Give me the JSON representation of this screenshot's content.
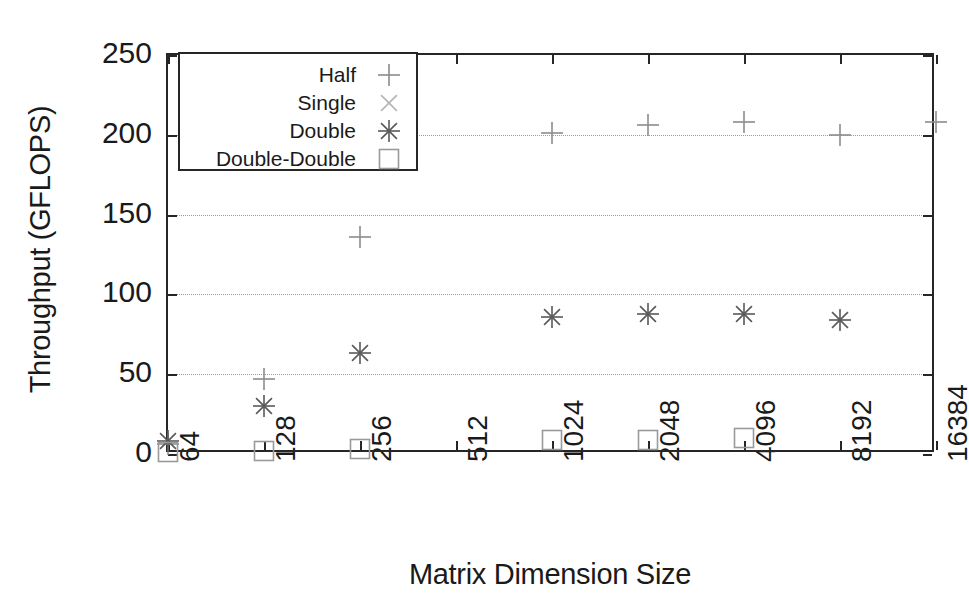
{
  "chart_data": {
    "type": "scatter",
    "title": "",
    "xlabel": "Matrix Dimension Size",
    "ylabel": "Throughput (GFLOPS)",
    "categories": [
      "64",
      "128",
      "256",
      "512",
      "1024",
      "2048",
      "4096",
      "8192",
      "16384"
    ],
    "xlim": [
      0,
      8
    ],
    "ylim": [
      0,
      250
    ],
    "yticks": [
      0,
      50,
      100,
      150,
      200,
      250
    ],
    "ytick_labels": [
      "0",
      "50",
      "100",
      "150",
      "200",
      "250"
    ],
    "grid": true,
    "grid_axis": "y",
    "legend_position": "top-left",
    "series": [
      {
        "name": "Half",
        "marker": "plus",
        "color": "#8c8c8c",
        "points": [
          {
            "x": "64",
            "y": 6
          },
          {
            "x": "128",
            "y": 47
          },
          {
            "x": "256",
            "y": 136
          },
          {
            "x": "1024",
            "y": 201
          },
          {
            "x": "2048",
            "y": 206
          },
          {
            "x": "4096",
            "y": 208
          },
          {
            "x": "8192",
            "y": 200
          },
          {
            "x": "16384",
            "y": 208
          }
        ]
      },
      {
        "name": "Single",
        "marker": "cross",
        "color": "#b5b5b5",
        "points": []
      },
      {
        "name": "Double",
        "marker": "asterisk",
        "color": "#595959",
        "points": [
          {
            "x": "64",
            "y": 8
          },
          {
            "x": "128",
            "y": 30
          },
          {
            "x": "256",
            "y": 63
          },
          {
            "x": "1024",
            "y": 86
          },
          {
            "x": "2048",
            "y": 88
          },
          {
            "x": "4096",
            "y": 88
          },
          {
            "x": "8192",
            "y": 84
          }
        ]
      },
      {
        "name": "Double-Double",
        "marker": "square",
        "color": "#9a9a9a",
        "points": [
          {
            "x": "64",
            "y": 1
          },
          {
            "x": "128",
            "y": 2
          },
          {
            "x": "256",
            "y": 3
          },
          {
            "x": "1024",
            "y": 9
          },
          {
            "x": "2048",
            "y": 9
          },
          {
            "x": "4096",
            "y": 10
          }
        ]
      }
    ]
  },
  "legend": {
    "entries": [
      {
        "label": "Half",
        "marker": "plus"
      },
      {
        "label": "Single",
        "marker": "cross"
      },
      {
        "label": "Double",
        "marker": "asterisk"
      },
      {
        "label": "Double-Double",
        "marker": "square"
      }
    ]
  },
  "colors": {
    "axis": "#262626",
    "grid": "#9a9a9a",
    "background": "#ffffff",
    "text": "#1a1a1a"
  }
}
